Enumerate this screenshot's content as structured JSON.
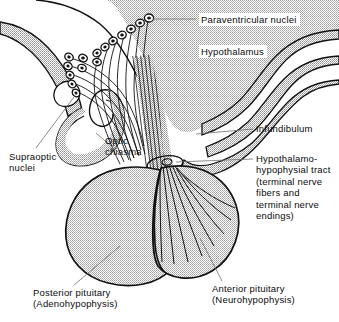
{
  "figure": {
    "background_color": "#ffffff",
    "stipple_fill_color": "#c9c9c9",
    "band_fill_color": "#d0d0d0",
    "outline_color": "#111111",
    "leader_line_color": "#6e6e6e",
    "text_color": "#0b0b0b"
  },
  "labels": {
    "paraventricular_nuclei": "Paraventricular nuclei",
    "hypothalamus": "Hypothalamus",
    "infundibulum": "Infundibulum",
    "hypothalamo_hypophysial_tract": "Hypothalamo-\nhypophysial tract\n(terminal nerve\nfibers and\nterminal nerve\nendings)",
    "supraoptic_nuclei": "Supraoptic\nnuclei",
    "optic_chiasma": "Optic\nchiasma",
    "posterior_pituitary": "Posterior pituitary\n(Adenohypophysis)",
    "anterior_pituitary": "Anterior pituitary\n(Neurohypophysis)"
  },
  "structures": {
    "paraventricular_nuclei_cell_count": 7,
    "supraoptic_nuclei_cell_count": 8,
    "pituitary_lobes": 2,
    "nerve_fiber_bundles": 9
  }
}
